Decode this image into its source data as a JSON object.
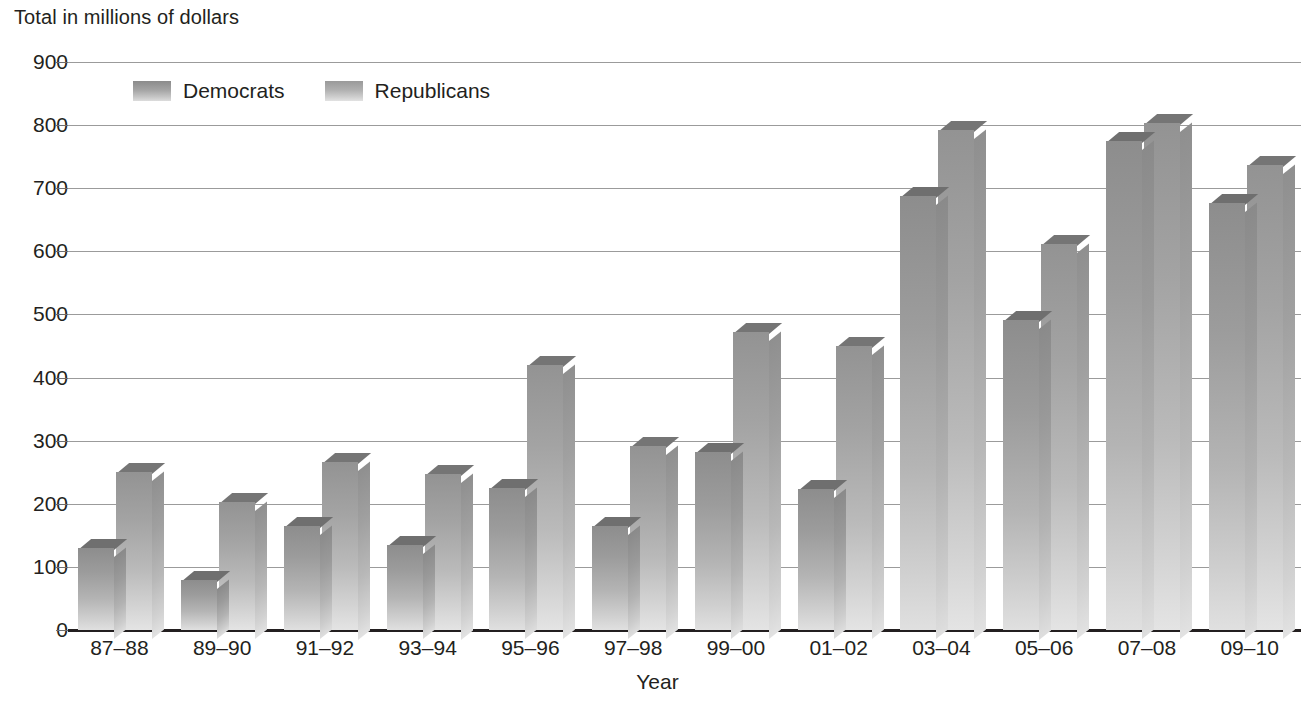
{
  "chart_data": {
    "type": "bar",
    "title": "Total in millions of dollars",
    "xlabel": "Year",
    "ylabel": "Total in millions of dollars",
    "categories": [
      "87–88",
      "89–90",
      "91–92",
      "93–94",
      "95–96",
      "97–98",
      "99–00",
      "01–02",
      "03–04",
      "05–06",
      "07–08",
      "09–10"
    ],
    "series": [
      {
        "name": "Democrats",
        "values": [
          130,
          80,
          165,
          135,
          225,
          165,
          282,
          223,
          688,
          492,
          775,
          677
        ]
      },
      {
        "name": "Republicans",
        "values": [
          250,
          203,
          267,
          248,
          420,
          291,
          472,
          450,
          792,
          612,
          804,
          737
        ]
      }
    ],
    "ylim": [
      0,
      900
    ],
    "yticks": [
      0,
      100,
      200,
      300,
      400,
      500,
      600,
      700,
      800,
      900
    ],
    "ytick_labels": [
      "0",
      "100",
      "200",
      "300",
      "400",
      "500",
      "600",
      "700",
      "800",
      "900"
    ],
    "grid": true,
    "legend_position": "top-left-inside",
    "legend": [
      "Democrats",
      "Republicans"
    ],
    "colors": {
      "democrats": "#9c9c9c",
      "republicans": "#b4b4b4",
      "gridline": "#9b9b9b",
      "axis": "#231f20",
      "text": "#231f20",
      "background": "#ffffff"
    }
  }
}
